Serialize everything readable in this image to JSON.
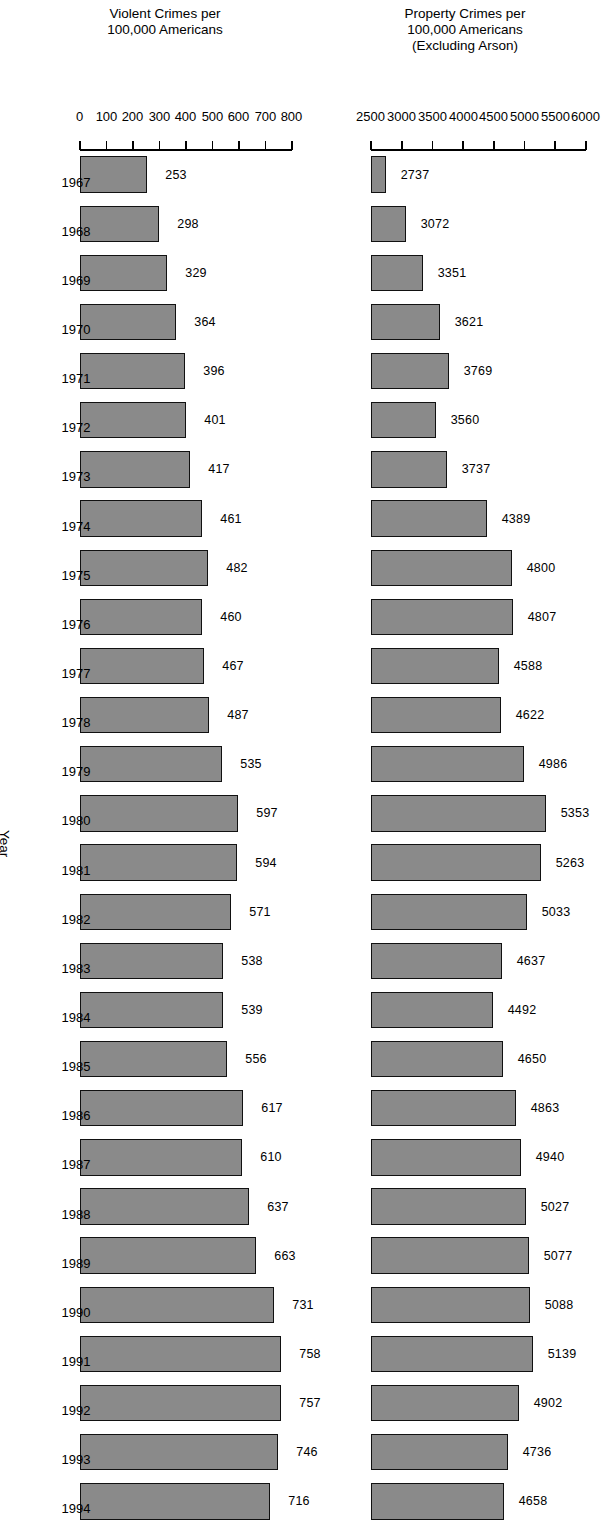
{
  "figure": {
    "orientation": "page rotated 90 degrees",
    "xaxis_title": "Year"
  },
  "chart_data": [
    {
      "type": "bar",
      "id": "property-crimes",
      "title": "",
      "xlabel": "Year",
      "ylabel": "Property Crimes per 100,000 Americans (Excluding Arson)",
      "ylabel_lines": [
        "Property Crimes per",
        "100,000 Americans",
        "(Excluding Arson)"
      ],
      "ylim": [
        2500,
        6000
      ],
      "yticks": [
        2500,
        3000,
        3500,
        4000,
        4500,
        5000,
        5500,
        6000
      ],
      "grid": false,
      "legend": "none",
      "bar_color": "#8a8a8a",
      "bar_edge_color": "#111111",
      "categories": [
        "1967",
        "1968",
        "1969",
        "1970",
        "1971",
        "1972",
        "1973",
        "1974",
        "1975",
        "1976",
        "1977",
        "1978",
        "1979",
        "1980",
        "1981",
        "1982",
        "1983",
        "1984",
        "1985",
        "1986",
        "1987",
        "1988",
        "1989",
        "1990",
        "1991",
        "1992",
        "1993",
        "1994"
      ],
      "values": [
        2737,
        3072,
        3351,
        3621,
        3769,
        3560,
        3737,
        4389,
        4800,
        4807,
        4588,
        4622,
        4986,
        5353,
        5263,
        5033,
        4637,
        4492,
        4650,
        4863,
        4940,
        5027,
        5077,
        5088,
        5139,
        4902,
        4736,
        4658
      ],
      "data_labels": [
        "2737",
        "3072",
        "3351",
        "3621",
        "3769",
        "3560",
        "3737",
        "4389",
        "4800",
        "4807",
        "4588",
        "4622",
        "4986",
        "5353",
        "5263",
        "5033",
        "4637",
        "4492",
        "4650",
        "4863",
        "4940",
        "5027",
        "5077",
        "5088",
        "5139",
        "4902",
        "4736",
        "4658"
      ]
    },
    {
      "type": "bar",
      "id": "violent-crimes",
      "title": "",
      "xlabel": "Year",
      "ylabel": "Violent Crimes per 100,000 Americans",
      "ylabel_lines": [
        "Violent Crimes per",
        "100,000 Americans"
      ],
      "ylim": [
        0,
        800
      ],
      "yticks": [
        0,
        100,
        200,
        300,
        400,
        500,
        600,
        700,
        800
      ],
      "grid": false,
      "legend": "none",
      "bar_color": "#8a8a8a",
      "bar_edge_color": "#111111",
      "categories": [
        "1967",
        "1968",
        "1969",
        "1970",
        "1971",
        "1972",
        "1973",
        "1974",
        "1975",
        "1976",
        "1977",
        "1978",
        "1979",
        "1980",
        "1981",
        "1982",
        "1983",
        "1984",
        "1985",
        "1986",
        "1987",
        "1988",
        "1989",
        "1990",
        "1991",
        "1992",
        "1993",
        "1994"
      ],
      "values": [
        253,
        298,
        329,
        364,
        396,
        401,
        417,
        461,
        482,
        460,
        467,
        487,
        535,
        597,
        594,
        571,
        538,
        539,
        556,
        617,
        610,
        637,
        663,
        731,
        758,
        757,
        746,
        716
      ],
      "data_labels": [
        "253",
        "298",
        "329",
        "364",
        "396",
        "401",
        "417",
        "461",
        "482",
        "460",
        "467",
        "487",
        "535",
        "597",
        "594",
        "571",
        "538",
        "539",
        "556",
        "617",
        "610",
        "637",
        "663",
        "731",
        "758",
        "757",
        "746",
        "716"
      ]
    }
  ]
}
